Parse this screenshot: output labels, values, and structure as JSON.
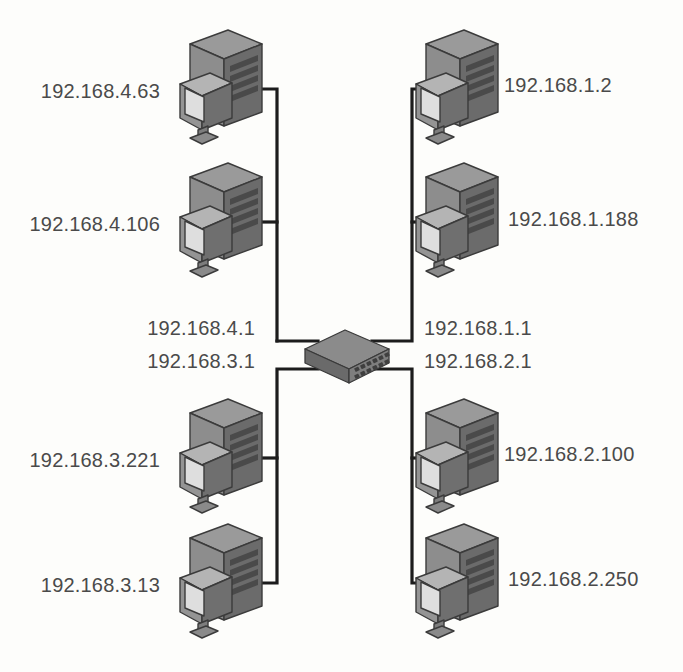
{
  "diagram": {
    "type": "network-topology",
    "background_color": "#fdfdfb",
    "label_color": "#4a4a4a",
    "wire_color": "#1c1c1c",
    "device_colors": {
      "tower_top": "#8f8f8f",
      "tower_left": "#9d9d9d",
      "tower_right": "#6e6e6e",
      "monitor_screen": "#d5d5d5",
      "switch_body": "#777777"
    },
    "central_device": {
      "name": "switch",
      "icon": "network-switch-icon",
      "ports_rows": 2,
      "ports_cols": 6
    },
    "gateways": [
      {
        "id": "gw-4",
        "label": "192.168.4.1",
        "position": "left-upper"
      },
      {
        "id": "gw-3",
        "label": "192.168.3.1",
        "position": "left-lower"
      },
      {
        "id": "gw-1",
        "label": "192.168.1.1",
        "position": "right-upper"
      },
      {
        "id": "gw-2",
        "label": "192.168.2.1",
        "position": "right-lower"
      }
    ],
    "hosts": [
      {
        "id": "host-4-63",
        "label": "192.168.4.63",
        "subnet": "192.168.4.0",
        "quadrant": "top-left",
        "label_side": "left",
        "icon": "computer-icon"
      },
      {
        "id": "host-4-106",
        "label": "192.168.4.106",
        "subnet": "192.168.4.0",
        "quadrant": "top-left",
        "label_side": "left",
        "icon": "computer-icon"
      },
      {
        "id": "host-1-2",
        "label": "192.168.1.2",
        "subnet": "192.168.1.0",
        "quadrant": "top-right",
        "label_side": "right",
        "icon": "computer-icon"
      },
      {
        "id": "host-1-188",
        "label": "192.168.1.188",
        "subnet": "192.168.1.0",
        "quadrant": "top-right",
        "label_side": "right",
        "icon": "computer-icon"
      },
      {
        "id": "host-3-221",
        "label": "192.168.3.221",
        "subnet": "192.168.3.0",
        "quadrant": "bottom-left",
        "label_side": "left",
        "icon": "computer-icon"
      },
      {
        "id": "host-3-13",
        "label": "192.168.3.13",
        "subnet": "192.168.3.0",
        "quadrant": "bottom-left",
        "label_side": "left",
        "icon": "computer-icon"
      },
      {
        "id": "host-2-100",
        "label": "192.168.2.100",
        "subnet": "192.168.2.0",
        "quadrant": "bottom-right",
        "label_side": "right",
        "icon": "computer-icon"
      },
      {
        "id": "host-2-250",
        "label": "192.168.2.250",
        "subnet": "192.168.2.0",
        "quadrant": "bottom-right",
        "label_side": "right",
        "icon": "computer-icon"
      }
    ]
  }
}
